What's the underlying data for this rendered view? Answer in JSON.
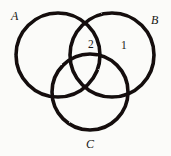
{
  "figure": {
    "background_color": "#fbfbf9",
    "stroke_color": "#121110",
    "stroke_width": 3.6
  },
  "sets": [
    {
      "id": "A",
      "label": "A",
      "icon": "circle-outline-icon",
      "cx": 58,
      "cy": 55,
      "r": 42,
      "label_x": 11,
      "label_y": 10
    },
    {
      "id": "B",
      "label": "B",
      "icon": "circle-outline-icon",
      "cx": 112,
      "cy": 55,
      "r": 42,
      "label_x": 151,
      "label_y": 14
    },
    {
      "id": "C",
      "label": "C",
      "icon": "circle-outline-icon",
      "cx": 90,
      "cy": 92,
      "r": 38,
      "label_x": 86,
      "label_y": 138
    }
  ],
  "regions": [
    {
      "id": "A-and-B-not-C",
      "value": "2",
      "x": 88,
      "y": 39
    },
    {
      "id": "B-only",
      "value": "1",
      "x": 121,
      "y": 40
    }
  ],
  "chart_data": {
    "type": "diagram",
    "diagram_type": "venn",
    "set_count": 3,
    "title": "",
    "set_labels": [
      "A",
      "B",
      "C"
    ],
    "labeled_regions": [
      {
        "region": "A ∩ B, excluding C",
        "label": "2"
      },
      {
        "region": "B only",
        "label": "1"
      }
    ],
    "unlabeled_regions": [
      "A only",
      "C only",
      "A ∩ C excluding B",
      "B ∩ C excluding A",
      "A ∩ B ∩ C"
    ],
    "filled": false,
    "legend": "none"
  }
}
